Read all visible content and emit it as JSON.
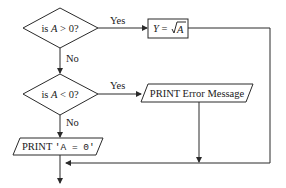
{
  "flowchart": {
    "decision1": {
      "prefix": "is ",
      "var": "A",
      "suffix": " > 0?"
    },
    "decision1_yes": "Yes",
    "decision1_no": "No",
    "process1": {
      "lhs": "Y",
      "eq": " = ",
      "radicand": "A"
    },
    "decision2": {
      "prefix": "is ",
      "var": "A",
      "suffix": " < 0?"
    },
    "decision2_yes": "Yes",
    "decision2_no": "No",
    "output1": "PRINT Error Message",
    "output2": {
      "keyword": "PRINT ",
      "literal": "'A = 0'"
    }
  }
}
